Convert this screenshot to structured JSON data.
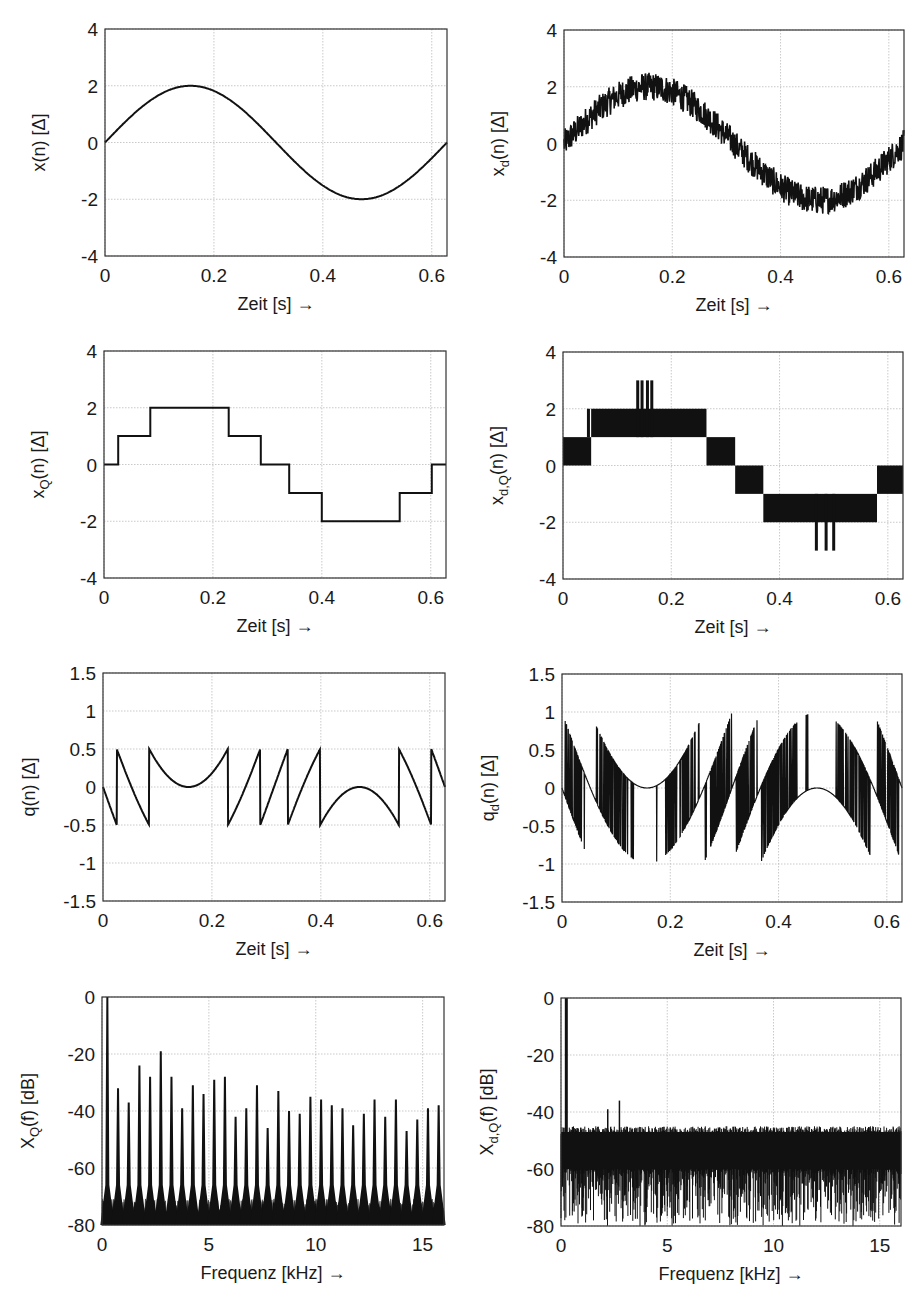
{
  "figure": {
    "colors": {
      "line": "#111111",
      "grid": "#bbbbbb",
      "axes": "#333333",
      "background": "#ffffff"
    }
  },
  "chart_data": [
    {
      "id": "x",
      "type": "line",
      "title": "",
      "ylabel": "x(n) [Δ]",
      "ylabel_main": "x",
      "ylabel_sub": "",
      "ylabel_rest": "(n) [Δ]",
      "xlabel": "Zeit [s] →",
      "xlim": [
        0,
        0.628
      ],
      "ylim": [
        -4,
        4
      ],
      "xticks": [
        0,
        0.2,
        0.4,
        0.6
      ],
      "xtick_labels": [
        "0",
        "0.2",
        "0.4",
        "0.6"
      ],
      "yticks": [
        -4,
        -2,
        0,
        2,
        4
      ],
      "ytick_labels": [
        "-4",
        "-2",
        "0",
        "2",
        "4"
      ],
      "grid": true,
      "series": [
        {
          "name": "x(n)",
          "kind": "sine",
          "amplitude": 2,
          "period_s": 0.628,
          "x": [
            0,
            0.0785,
            0.157,
            0.2355,
            0.314,
            0.3925,
            0.471,
            0.5495,
            0.628
          ],
          "y": [
            0,
            1.41,
            2,
            1.41,
            0,
            -1.41,
            -2,
            -1.41,
            0
          ]
        }
      ]
    },
    {
      "id": "xd",
      "type": "line",
      "ylabel": "x_d(n) [Δ]",
      "ylabel_main": "x",
      "ylabel_sub": "d",
      "ylabel_rest": "(n) [Δ]",
      "xlabel": "Zeit [s] →",
      "xlim": [
        0,
        0.628
      ],
      "ylim": [
        -4,
        4
      ],
      "xticks": [
        0,
        0.2,
        0.4,
        0.6
      ],
      "xtick_labels": [
        "0",
        "0.2",
        "0.4",
        "0.6"
      ],
      "yticks": [
        -4,
        -2,
        0,
        2,
        4
      ],
      "ytick_labels": [
        "-4",
        "-2",
        "0",
        "2",
        "4"
      ],
      "grid": true,
      "series": [
        {
          "name": "x_d(n)",
          "kind": "sine_plus_dither",
          "amplitude": 2,
          "dither_peak": 0.5,
          "note": "sine with dither noise band approx ±0.5"
        }
      ]
    },
    {
      "id": "xQ",
      "type": "line",
      "ylabel": "x_Q(n) [Δ]",
      "ylabel_main": "x",
      "ylabel_sub": "Q",
      "ylabel_rest": "(n) [Δ]",
      "xlabel": "Zeit [s] →",
      "xlim": [
        0,
        0.628
      ],
      "ylim": [
        -4,
        4
      ],
      "xticks": [
        0,
        0.2,
        0.4,
        0.6
      ],
      "xtick_labels": [
        "0",
        "0.2",
        "0.4",
        "0.6"
      ],
      "yticks": [
        -4,
        -2,
        0,
        2,
        4
      ],
      "ytick_labels": [
        "-4",
        "-2",
        "0",
        "2",
        "4"
      ],
      "grid": true,
      "series": [
        {
          "name": "x_Q(n)",
          "kind": "step",
          "x": [
            0,
            0.026,
            0.026,
            0.085,
            0.085,
            0.229,
            0.229,
            0.288,
            0.288,
            0.34,
            0.34,
            0.4,
            0.4,
            0.543,
            0.543,
            0.602,
            0.602,
            0.628
          ],
          "y": [
            0,
            0,
            1,
            1,
            2,
            2,
            1,
            1,
            0,
            0,
            -1,
            -1,
            -2,
            -2,
            -1,
            -1,
            0,
            0
          ]
        }
      ]
    },
    {
      "id": "xdQ",
      "type": "line",
      "ylabel": "x_d,Q(n) [Δ]",
      "ylabel_main": "x",
      "ylabel_sub": "d,Q",
      "ylabel_rest": "(n) [Δ]",
      "xlabel": "Zeit [s] →",
      "xlim": [
        0,
        0.628
      ],
      "ylim": [
        -4,
        4
      ],
      "xticks": [
        0,
        0.2,
        0.4,
        0.6
      ],
      "xtick_labels": [
        "0",
        "0.2",
        "0.4",
        "0.6"
      ],
      "yticks": [
        -4,
        -2,
        0,
        2,
        4
      ],
      "ytick_labels": [
        "-4",
        "-2",
        "0",
        "2",
        "4"
      ],
      "grid": true,
      "bands": [
        {
          "x0": 0.0,
          "x1": 0.052,
          "y0": 0,
          "y1": 1
        },
        {
          "x0": 0.052,
          "x1": 0.265,
          "y0": 1,
          "y1": 2
        },
        {
          "x0": 0.265,
          "x1": 0.318,
          "y0": 0,
          "y1": 1
        },
        {
          "x0": 0.318,
          "x1": 0.37,
          "y0": -1,
          "y1": 0
        },
        {
          "x0": 0.37,
          "x1": 0.58,
          "y0": -2,
          "y1": -1
        },
        {
          "x0": 0.58,
          "x1": 0.628,
          "y0": -1,
          "y1": 0
        }
      ],
      "spikes": [
        {
          "x": 0.138,
          "y0": 1,
          "y1": 3
        },
        {
          "x": 0.146,
          "y0": 1,
          "y1": 3
        },
        {
          "x": 0.156,
          "y0": 1,
          "y1": 3
        },
        {
          "x": 0.164,
          "y0": 1,
          "y1": 3
        },
        {
          "x": 0.047,
          "y0": 1,
          "y1": 2
        },
        {
          "x": 0.468,
          "y0": -1,
          "y1": -3
        },
        {
          "x": 0.486,
          "y0": -1,
          "y1": -3
        },
        {
          "x": 0.5,
          "y0": -1,
          "y1": -3
        }
      ]
    },
    {
      "id": "q",
      "type": "line",
      "ylabel": "q(n) [Δ]",
      "ylabel_main": "q",
      "ylabel_sub": "",
      "ylabel_rest": "(n) [Δ]",
      "xlabel": "Zeit [s] →",
      "xlim": [
        0,
        0.628
      ],
      "ylim": [
        -1.5,
        1.5
      ],
      "xticks": [
        0,
        0.2,
        0.4,
        0.6
      ],
      "xtick_labels": [
        "0",
        "0.2",
        "0.4",
        "0.6"
      ],
      "yticks": [
        -1.5,
        -1,
        -0.5,
        0,
        0.5,
        1,
        1.5
      ],
      "ytick_labels": [
        "-1.5",
        "-1",
        "-0.5",
        "0",
        "0.5",
        "1",
        "1.5"
      ],
      "grid": true,
      "series": [
        {
          "name": "q(n)",
          "kind": "quantization_error",
          "definition": "x_Q(n) - x(n)",
          "range": [
            -0.5,
            0.5
          ]
        }
      ]
    },
    {
      "id": "qd",
      "type": "line",
      "ylabel": "q_d(n) [Δ]",
      "ylabel_main": "q",
      "ylabel_sub": "d",
      "ylabel_rest": "(n) [Δ]",
      "xlabel": "Zeit [s] →",
      "xlim": [
        0,
        0.628
      ],
      "ylim": [
        -1.5,
        1.5
      ],
      "xticks": [
        0,
        0.2,
        0.4,
        0.6
      ],
      "xtick_labels": [
        "0",
        "0.2",
        "0.4",
        "0.6"
      ],
      "yticks": [
        -1.5,
        -1,
        -0.5,
        0,
        0.5,
        1,
        1.5
      ],
      "ytick_labels": [
        "-1.5",
        "-1",
        "-0.5",
        "0",
        "0.5",
        "1",
        "1.5"
      ],
      "grid": true,
      "series": [
        {
          "name": "q_d(n)",
          "kind": "dithered_quantization_error_band",
          "range": [
            -1.1,
            1.1
          ]
        }
      ]
    },
    {
      "id": "XQ",
      "type": "bar",
      "ylabel": "X_Q(f) [dB]",
      "ylabel_main": "X",
      "ylabel_sub": "Q",
      "ylabel_rest": "(f) [dB]",
      "xlabel": "Frequenz [kHz] →",
      "xlim": [
        0,
        16
      ],
      "ylim": [
        -80,
        0
      ],
      "xticks": [
        0,
        5,
        10,
        15
      ],
      "xtick_labels": [
        "0",
        "5",
        "10",
        "15"
      ],
      "yticks": [
        -80,
        -60,
        -40,
        -20,
        0
      ],
      "ytick_labels": [
        "-80",
        "-60",
        "-40",
        "-20",
        "0"
      ],
      "grid": true,
      "noise_floor_db": -75,
      "peaks": {
        "x": [
          0.25,
          0.75,
          1.25,
          1.75,
          2.25,
          2.75,
          3.25,
          3.75,
          4.25,
          4.75,
          5.25,
          5.75,
          6.25,
          6.75,
          7.25,
          7.75,
          8.25,
          8.75,
          9.25,
          9.75,
          10.25,
          10.75,
          11.25,
          11.75,
          12.25,
          12.75,
          13.25,
          13.75,
          14.25,
          14.75,
          15.25,
          15.75
        ],
        "y": [
          0,
          -32,
          -37,
          -24,
          -28,
          -19,
          -28,
          -39,
          -31,
          -34,
          -29,
          -28,
          -42,
          -39,
          -31,
          -46,
          -33,
          -40,
          -41,
          -35,
          -36,
          -38,
          -39,
          -45,
          -41,
          -36,
          -42,
          -36,
          -47,
          -43,
          -39,
          -38
        ]
      }
    },
    {
      "id": "XdQ",
      "type": "bar",
      "ylabel": "X_d,Q(f) [dB]",
      "ylabel_main": "X",
      "ylabel_sub": "d,Q",
      "ylabel_rest": "(f) [dB]",
      "xlabel": "Frequenz [kHz] →",
      "xlim": [
        0,
        16
      ],
      "ylim": [
        -80,
        0
      ],
      "xticks": [
        0,
        5,
        10,
        15
      ],
      "xtick_labels": [
        "0",
        "5",
        "10",
        "15"
      ],
      "yticks": [
        -80,
        -60,
        -40,
        -20,
        0
      ],
      "ytick_labels": [
        "-80",
        "-60",
        "-40",
        "-20",
        "0"
      ],
      "grid": true,
      "peaks": {
        "x": [
          0.25
        ],
        "y": [
          0
        ]
      },
      "noise_band_db": [
        -80,
        -43
      ],
      "notable": [
        {
          "x": 2.75,
          "y": -36
        },
        {
          "x": 2.2,
          "y": -39
        }
      ]
    }
  ]
}
